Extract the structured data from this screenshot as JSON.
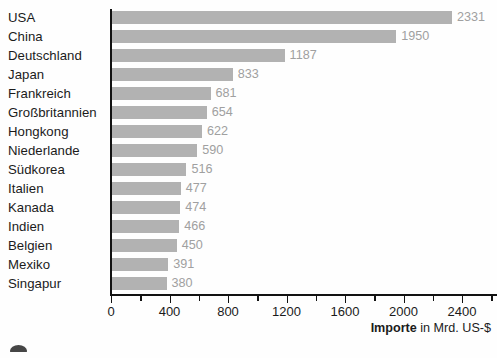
{
  "chart_data": {
    "type": "bar",
    "orientation": "horizontal",
    "title": "",
    "subtitle": "",
    "xlabel_bold": "Importe",
    "xlabel_rest": " in Mrd. US-$",
    "ylabel": "",
    "categories": [
      "USA",
      "China",
      "Deutschland",
      "Japan",
      "Frankreich",
      "Großbritannien",
      "Hongkong",
      "Niederlande",
      "Südkorea",
      "Italien",
      "Kanada",
      "Indien",
      "Belgien",
      "Mexiko",
      "Singapur"
    ],
    "values": [
      2331,
      1950,
      1187,
      833,
      681,
      654,
      622,
      590,
      516,
      477,
      474,
      466,
      450,
      391,
      380
    ],
    "value_labels": [
      "2331",
      "1950",
      "1187",
      "833",
      "681",
      "654",
      "622",
      "590",
      "516",
      "477",
      "474",
      "466",
      "450",
      "391",
      "380"
    ],
    "xlim": [
      0,
      2645
    ],
    "xticks_major": [
      0,
      400,
      800,
      1200,
      1600,
      2000,
      2400
    ],
    "xtick_labels": [
      "0",
      "400",
      "800",
      "1200",
      "1600",
      "2000",
      "2400"
    ],
    "xticks_minor": [
      200,
      600,
      1000,
      1400,
      1800,
      2200,
      2600
    ],
    "grid": false,
    "legend": false,
    "bar_color": "#b2b2b2",
    "value_label_color": "#a0a0a0",
    "axis_color": "#121212",
    "text_color": "#1b1b1b",
    "background": "#fefefe"
  }
}
